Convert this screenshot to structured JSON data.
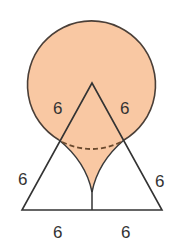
{
  "figure": {
    "type": "geometry",
    "colors": {
      "fill": "#F9C8A3",
      "stroke": "#3a3a3a",
      "circle_stroke": "#4a3f38",
      "dashed": "#6b4a2e"
    },
    "labels": {
      "upper_left": "6",
      "upper_right": "6",
      "left_side": "6",
      "right_side": "6",
      "base_left": "6",
      "base_right": "6"
    }
  }
}
